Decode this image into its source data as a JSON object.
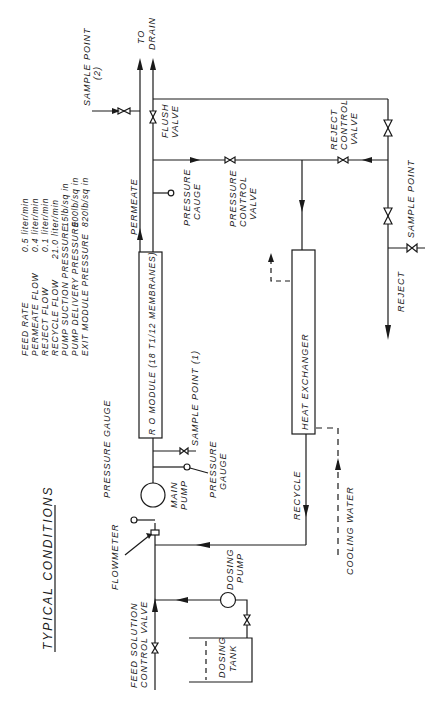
{
  "title": "TYPICAL CONDITIONS",
  "conditions": [
    {
      "label": "FEED RATE",
      "value": "0.5 liter/min"
    },
    {
      "label": "PERMEATE FLOW",
      "value": "0.4 liter/min"
    },
    {
      "label": "REJECT FLOW",
      "value": "0.1 liter/min"
    },
    {
      "label": "RECYCLE FLOW",
      "value": "21.0 liter/min"
    },
    {
      "label": "PUMP SUCTION PRESSURE",
      "value": "15lb/sq in"
    },
    {
      "label": "PUMP DELIVERY PRESSURE",
      "value": "900lb/sq in"
    },
    {
      "label": "EXIT MODULE PRESSURE",
      "value": "820lb/sq in"
    }
  ],
  "labels": {
    "sample_point_2": "SAMPLE POINT",
    "sample_point_2_num": "(2)",
    "to": "TO",
    "drain": "DRAIN",
    "flush": "FLUSH",
    "valve": "VALVE",
    "permeate": "PERMEATE",
    "pressure_gauge_top_1": "PRESSURE",
    "pressure_gauge_top_2": "CAUGE",
    "pcv_1": "PRESSURE",
    "pcv_2": "CONTROL",
    "pcv_3": "VALVE",
    "rcv_1": "REJECT",
    "rcv_2": "CONTROL",
    "rcv_3": "VALVE",
    "sample_point_right": "SAMPLE POINT",
    "reject": "REJECT",
    "ro_module": "R O  MODULE (18 T1/12 MEMBRANES)",
    "sample_point_1": "SAMPLE POINT (1)",
    "heat_exchanger": "HEAT   EXCHANGER",
    "pressure_gauge_left": "PRESSURE GAUGE",
    "pressure_gauge_mid_1": "PRESSURE",
    "pressure_gauge_mid_2": "GAUGE",
    "main_pump_1": "MAIN",
    "main_pump_2": "PUMP",
    "recycle": "RECYCLE",
    "cooling_water": "COOLING WATER",
    "flowmeter": "FLOWMETER",
    "dosing_pump_1": "DOSING",
    "dosing_pump_2": "PUMP",
    "feed_valve_1": "FEED SOLUTION",
    "feed_valve_2": "CONTROL VALVE",
    "dosing_tank_1": "DOSING",
    "dosing_tank_2": "TANK"
  }
}
